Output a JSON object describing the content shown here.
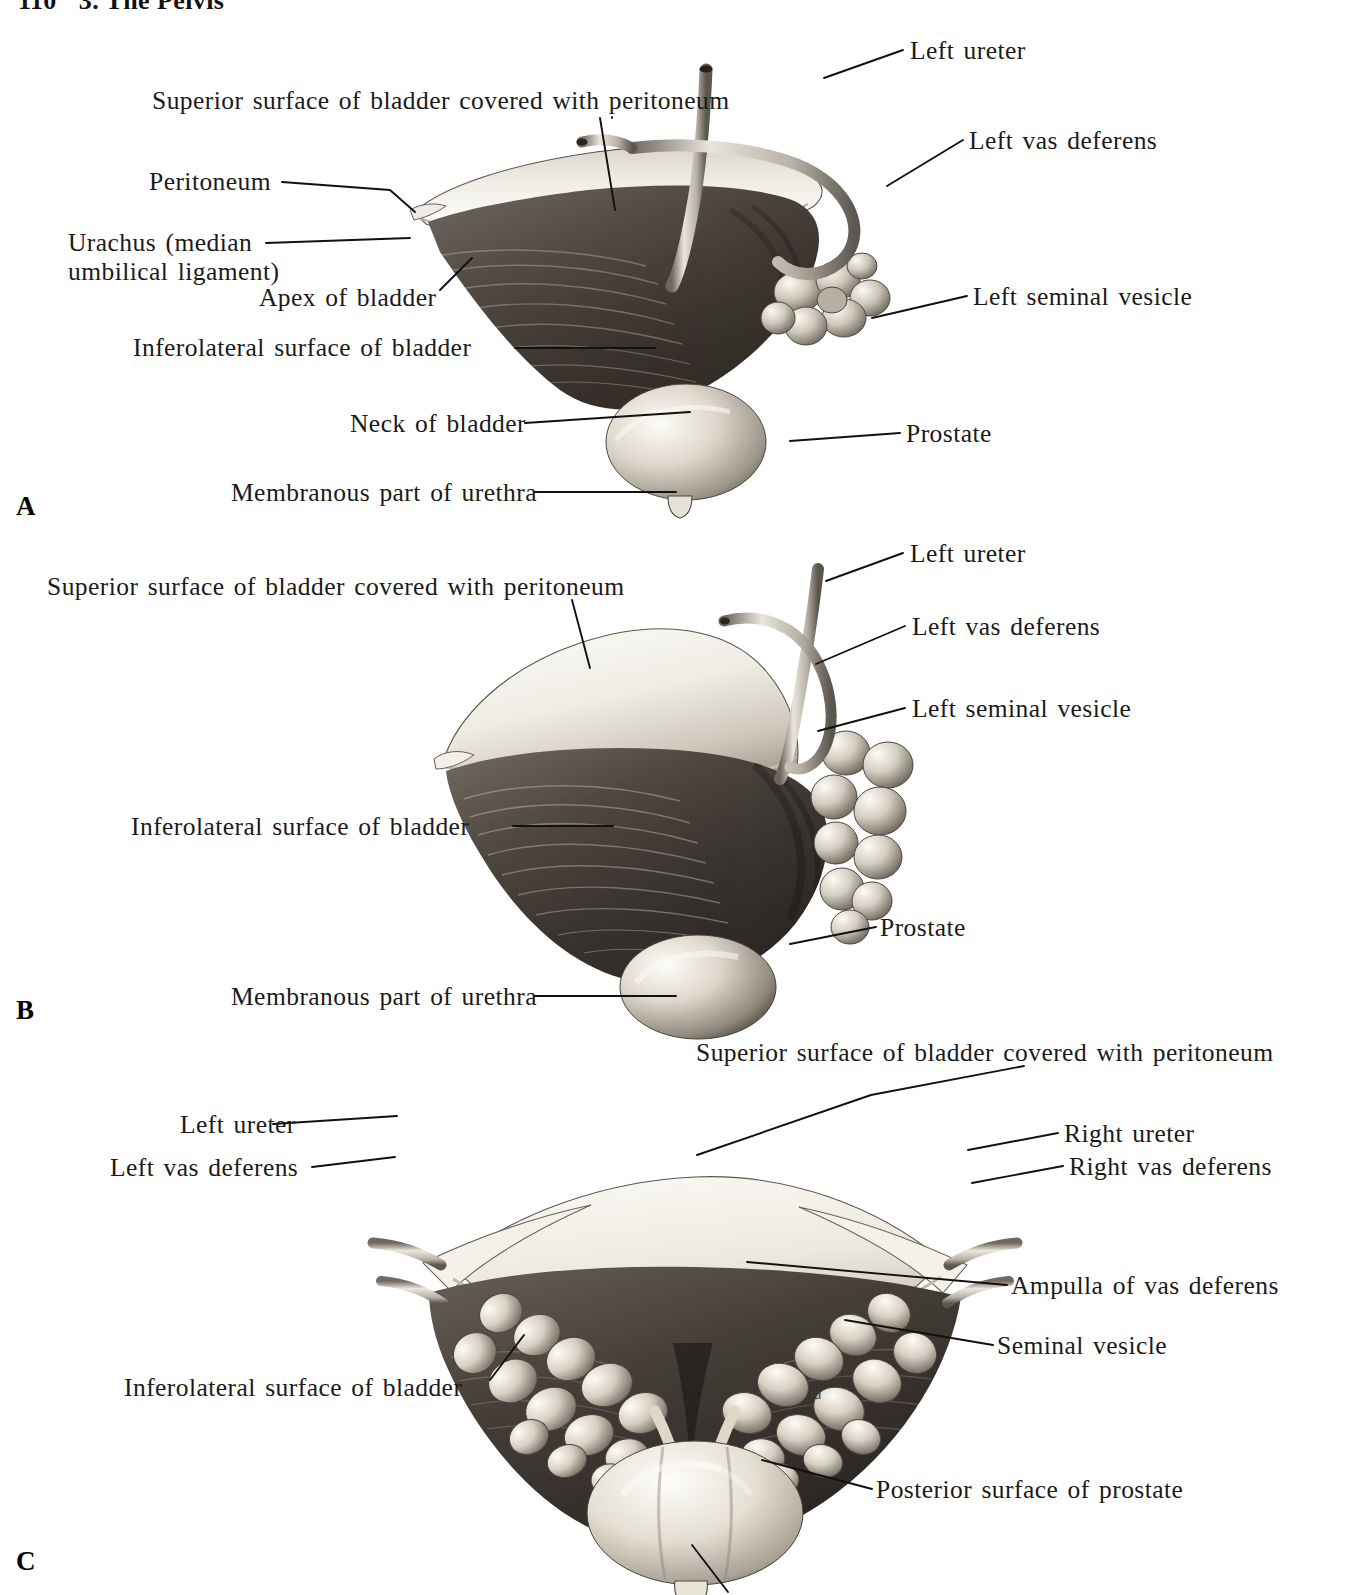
{
  "page": {
    "folio": "110",
    "running_head": "3. The Pelvis",
    "artist_monogram": "td"
  },
  "figures": [
    {
      "id": "A",
      "letter": "A",
      "labels": [
        {
          "name": "superior-surface-bladder",
          "text": "Superior surface of bladder covered with peritoneum",
          "side": "left"
        },
        {
          "name": "peritoneum",
          "text": "Peritoneum",
          "side": "left"
        },
        {
          "name": "urachus",
          "text": "Urachus (median\numbilical ligament)",
          "side": "left"
        },
        {
          "name": "apex-of-bladder",
          "text": "Apex of bladder",
          "side": "left"
        },
        {
          "name": "inferolateral-surface-bladder",
          "text": "Inferolateral surface of bladder",
          "side": "left"
        },
        {
          "name": "neck-of-bladder",
          "text": "Neck of bladder",
          "side": "left"
        },
        {
          "name": "membranous-urethra",
          "text": "Membranous part of urethra",
          "side": "left"
        },
        {
          "name": "left-ureter",
          "text": "Left ureter",
          "side": "right"
        },
        {
          "name": "left-vas-deferens",
          "text": "Left vas deferens",
          "side": "right"
        },
        {
          "name": "left-seminal-vesicle",
          "text": "Left seminal vesicle",
          "side": "right"
        },
        {
          "name": "prostate",
          "text": "Prostate",
          "side": "right"
        }
      ]
    },
    {
      "id": "B",
      "letter": "B",
      "labels": [
        {
          "name": "superior-surface-bladder",
          "text": "Superior surface of bladder covered with peritoneum",
          "side": "left"
        },
        {
          "name": "inferolateral-surface-bladder",
          "text": "Inferolateral surface of bladder",
          "side": "left"
        },
        {
          "name": "membranous-urethra",
          "text": "Membranous part of urethra",
          "side": "left"
        },
        {
          "name": "left-ureter",
          "text": "Left ureter",
          "side": "right"
        },
        {
          "name": "left-vas-deferens",
          "text": "Left vas deferens",
          "side": "right"
        },
        {
          "name": "left-seminal-vesicle",
          "text": "Left seminal vesicle",
          "side": "right"
        },
        {
          "name": "prostate",
          "text": "Prostate",
          "side": "right"
        }
      ]
    },
    {
      "id": "C",
      "letter": "C",
      "labels": [
        {
          "name": "left-ureter",
          "text": "Left ureter",
          "side": "left"
        },
        {
          "name": "left-vas-deferens",
          "text": "Left vas deferens",
          "side": "left"
        },
        {
          "name": "inferolateral-surface-bladder",
          "text": "Inferolateral surface of bladder",
          "side": "left"
        },
        {
          "name": "superior-surface-bladder",
          "text": "Superior surface of bladder covered with peritoneum",
          "side": "right"
        },
        {
          "name": "right-ureter",
          "text": "Right ureter",
          "side": "right"
        },
        {
          "name": "right-vas-deferens",
          "text": "Right vas deferens",
          "side": "right"
        },
        {
          "name": "ampulla-of-vas-deferens",
          "text": "Ampulla of vas deferens",
          "side": "right"
        },
        {
          "name": "seminal-vesicle",
          "text": "Seminal vesicle",
          "side": "right"
        },
        {
          "name": "posterior-surface-prostate",
          "text": "Posterior surface of prostate",
          "side": "right"
        }
      ]
    }
  ],
  "colors": {
    "ink": "#1a1a1a",
    "leader": "#111111",
    "bladder_dark": "#4a4540",
    "bladder_light": "#e8e4dc",
    "vesicle": "#d8d2c6",
    "prostate": "#ece7dd",
    "tube": "#cfcabf"
  }
}
